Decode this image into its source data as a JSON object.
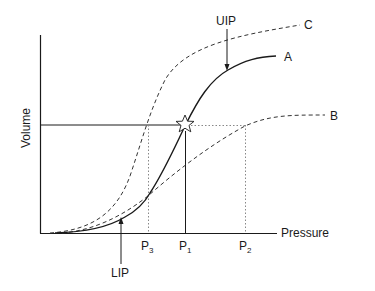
{
  "diagram": {
    "type": "pressure-volume curves",
    "axes": {
      "x_label": "Pressure",
      "y_label": "Volume"
    },
    "curves": [
      {
        "id": "A",
        "label": "A",
        "style": "solid"
      },
      {
        "id": "B",
        "label": "B",
        "style": "dashed"
      },
      {
        "id": "C",
        "label": "C",
        "style": "dashed"
      }
    ],
    "annotations": {
      "uip": "UIP",
      "lip": "LIP"
    },
    "pressure_marks": {
      "p3": {
        "base": "P",
        "sub": "3"
      },
      "p1": {
        "base": "P",
        "sub": "1"
      },
      "p2": {
        "base": "P",
        "sub": "2"
      }
    },
    "marker": "star"
  },
  "colors": {
    "line": "#1a1a1a",
    "dotted": "#888888",
    "background": "#ffffff"
  }
}
